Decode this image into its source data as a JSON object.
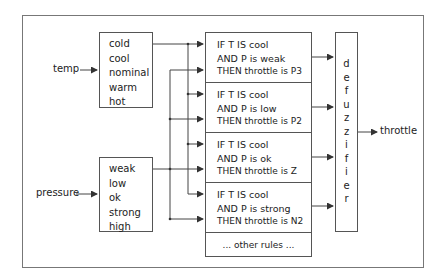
{
  "inputs": {
    "temp": {
      "label": "temp",
      "sets": [
        "cold",
        "cool",
        "nominal",
        "warm",
        "hot"
      ]
    },
    "pressure": {
      "label": "pressure",
      "sets": [
        "weak",
        "low",
        "ok",
        "strong",
        "high"
      ]
    }
  },
  "rules": [
    {
      "line1": "IF  T  IS  cool",
      "line2": "AND  P  is  weak",
      "line3": "THEN throttle is P3"
    },
    {
      "line1": "IF  T  IS  cool",
      "line2": "AND  P  is  low",
      "line3": "THEN throttle is P2"
    },
    {
      "line1": "IF  T  IS  cool",
      "line2": "AND  P  is  ok",
      "line3": "THEN throttle is Z"
    },
    {
      "line1": "IF  T  IS  cool",
      "line2": "AND  P  is  strong",
      "line3": "THEN throttle is N2"
    }
  ],
  "other_rules": "... other rules ...",
  "defuzzifier": [
    "d",
    "e",
    "f",
    "u",
    "z",
    "z",
    "i",
    "f",
    "i",
    "e",
    "r"
  ],
  "output": {
    "label": "throttle"
  }
}
